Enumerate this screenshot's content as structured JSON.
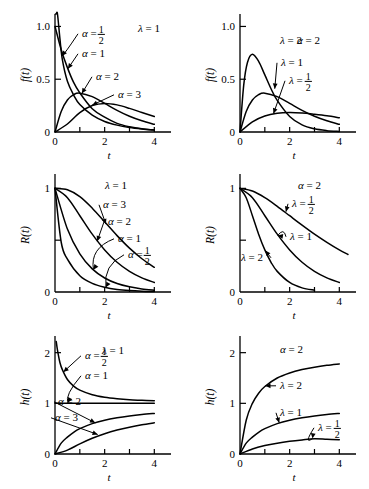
{
  "figure": {
    "name": "gamma-distribution-figure",
    "columns": [
      "varying alpha with lambda = 1",
      "varying lambda with alpha = 2"
    ],
    "rows": [
      "density f(t)",
      "reliability R(t)",
      "hazard h(t)"
    ]
  },
  "chart_data": [
    {
      "id": "panel-density-alpha",
      "type": "line",
      "title": "",
      "xlabel": "t",
      "ylabel": "f(t)",
      "xlim": [
        0,
        4.35
      ],
      "ylim": [
        0,
        1.08
      ],
      "xticks": [
        0,
        1,
        2,
        3,
        4
      ],
      "xticklabels": [
        "0",
        "",
        "2",
        "",
        "4"
      ],
      "yticks": [
        0,
        0.5,
        1.0
      ],
      "yticklabels": [
        "0",
        "0.5",
        "1.0"
      ],
      "grid": false,
      "legend": "inline-annotations",
      "fixed_param": {
        "symbol": "λ",
        "value": "1",
        "label": "λ = 1"
      },
      "series": [
        {
          "name": "alpha-one-half",
          "label": "α =",
          "label_frac": "1/2",
          "alpha": 0.5,
          "lambda": 1,
          "x": [
            0.02,
            0.05,
            0.1,
            0.2,
            0.3,
            0.5,
            0.75,
            1,
            1.5,
            2,
            2.5,
            3,
            3.5,
            4
          ],
          "y": [
            2.0,
            1.74,
            1.29,
            0.88,
            0.68,
            0.48,
            0.35,
            0.26,
            0.16,
            0.1,
            0.065,
            0.043,
            0.029,
            0.019
          ]
        },
        {
          "name": "alpha-one",
          "label": "α = 1",
          "alpha": 1,
          "lambda": 1,
          "x": [
            0,
            0.25,
            0.5,
            0.75,
            1,
            1.5,
            2,
            2.5,
            3,
            3.5,
            4
          ],
          "y": [
            1.0,
            0.78,
            0.61,
            0.47,
            0.37,
            0.22,
            0.14,
            0.082,
            0.05,
            0.03,
            0.018
          ]
        },
        {
          "name": "alpha-two",
          "label": "α = 2",
          "alpha": 2,
          "lambda": 1,
          "x": [
            0,
            0.25,
            0.5,
            0.75,
            1,
            1.5,
            2,
            2.5,
            3,
            3.5,
            4
          ],
          "y": [
            0,
            0.195,
            0.303,
            0.354,
            0.368,
            0.335,
            0.271,
            0.205,
            0.149,
            0.106,
            0.073
          ]
        },
        {
          "name": "alpha-three",
          "label": "α = 3",
          "alpha": 3,
          "lambda": 1,
          "x": [
            0,
            0.5,
            1,
            1.5,
            2,
            2.5,
            3,
            3.5,
            4
          ],
          "y": [
            0,
            0.076,
            0.184,
            0.251,
            0.271,
            0.257,
            0.224,
            0.185,
            0.147
          ]
        }
      ]
    },
    {
      "id": "panel-density-lambda",
      "type": "line",
      "title": "",
      "xlabel": "t",
      "ylabel": "f(t)",
      "xlim": [
        0,
        4.35
      ],
      "ylim": [
        0,
        1.08
      ],
      "xticks": [
        0,
        1,
        2,
        3,
        4
      ],
      "xticklabels": [
        "0",
        "",
        "2",
        "",
        "4"
      ],
      "yticks": [
        0,
        0.5,
        1.0
      ],
      "yticklabels": [
        "0",
        "0.5",
        "1.0"
      ],
      "grid": false,
      "fixed_param": {
        "symbol": "α",
        "value": "2",
        "label": "α = 2"
      },
      "series": [
        {
          "name": "lambda-two",
          "label": "λ = 2",
          "alpha": 2,
          "lambda": 2,
          "x": [
            0,
            0.15,
            0.3,
            0.5,
            0.75,
            1,
            1.25,
            1.5,
            2,
            2.5,
            3,
            3.5,
            4
          ],
          "y": [
            0,
            0.444,
            0.659,
            0.736,
            0.669,
            0.541,
            0.41,
            0.299,
            0.147,
            0.067,
            0.03,
            0.013,
            0.005
          ]
        },
        {
          "name": "lambda-one",
          "label": "λ = 1",
          "alpha": 2,
          "lambda": 1,
          "x": [
            0,
            0.25,
            0.5,
            0.75,
            1,
            1.5,
            2,
            2.5,
            3,
            3.5,
            4
          ],
          "y": [
            0,
            0.195,
            0.303,
            0.354,
            0.368,
            0.335,
            0.271,
            0.205,
            0.149,
            0.106,
            0.073
          ]
        },
        {
          "name": "lambda-one-half",
          "label": "λ =",
          "label_frac": "1/2",
          "alpha": 2,
          "lambda": 0.5,
          "x": [
            0,
            0.5,
            1,
            1.5,
            2,
            2.5,
            3,
            3.5,
            4
          ],
          "y": [
            0,
            0.097,
            0.152,
            0.177,
            0.184,
            0.179,
            0.167,
            0.153,
            0.135
          ]
        }
      ]
    },
    {
      "id": "panel-reliability-alpha",
      "type": "line",
      "title": "",
      "xlabel": "t",
      "ylabel": "R(t)",
      "xlim": [
        0,
        4.35
      ],
      "ylim": [
        0,
        1.1
      ],
      "xticks": [
        0,
        1,
        2,
        3,
        4
      ],
      "xticklabels": [
        "0",
        "",
        "2",
        "",
        "4"
      ],
      "yticks": [
        0,
        0.5,
        1
      ],
      "yticklabels": [
        "0",
        "",
        "1"
      ],
      "grid": false,
      "fixed_param": {
        "symbol": "λ",
        "value": "1",
        "label": "λ = 1"
      },
      "series": [
        {
          "name": "alpha-three",
          "label": "α = 3",
          "alpha": 3,
          "lambda": 1,
          "x": [
            0,
            0.5,
            1,
            1.5,
            2,
            2.5,
            3,
            3.5,
            4
          ],
          "y": [
            1.0,
            0.986,
            0.92,
            0.809,
            0.677,
            0.544,
            0.423,
            0.321,
            0.238
          ]
        },
        {
          "name": "alpha-two",
          "label": "α = 2",
          "alpha": 2,
          "lambda": 1,
          "x": [
            0,
            0.5,
            1,
            1.5,
            2,
            2.5,
            3,
            3.5,
            4
          ],
          "y": [
            1.0,
            0.91,
            0.736,
            0.558,
            0.406,
            0.287,
            0.199,
            0.136,
            0.092
          ]
        },
        {
          "name": "alpha-one",
          "label": "α = 1",
          "alpha": 1,
          "lambda": 1,
          "x": [
            0,
            0.5,
            1,
            1.5,
            2,
            2.5,
            3,
            3.5,
            4
          ],
          "y": [
            1.0,
            0.607,
            0.368,
            0.223,
            0.135,
            0.082,
            0.05,
            0.03,
            0.018
          ]
        },
        {
          "name": "alpha-one-half",
          "label": "α =",
          "label_frac": "1/2",
          "alpha": 0.5,
          "lambda": 1,
          "x": [
            0,
            0.25,
            0.5,
            1,
            1.5,
            2,
            2.5,
            3,
            3.5,
            4
          ],
          "y": [
            1.0,
            0.48,
            0.317,
            0.157,
            0.083,
            0.046,
            0.025,
            0.014,
            0.008,
            0.005
          ]
        }
      ]
    },
    {
      "id": "panel-reliability-lambda",
      "type": "line",
      "title": "",
      "xlabel": "t",
      "ylabel": "R(t)",
      "xlim": [
        0,
        4.35
      ],
      "ylim": [
        0,
        1.1
      ],
      "xticks": [
        0,
        1,
        2,
        3,
        4
      ],
      "xticklabels": [
        "0",
        "",
        "2",
        "",
        "4"
      ],
      "yticks": [
        0,
        0.5,
        1
      ],
      "yticklabels": [
        "0",
        "",
        "1"
      ],
      "grid": false,
      "fixed_param": {
        "symbol": "α",
        "value": "2",
        "label": "α = 2"
      },
      "series": [
        {
          "name": "lambda-one-half",
          "label": "λ =",
          "label_frac": "1/2",
          "alpha": 2,
          "lambda": 0.5,
          "x": [
            0,
            0.5,
            1,
            1.5,
            2,
            2.5,
            3,
            3.5,
            4,
            4.35
          ],
          "y": [
            1.0,
            0.974,
            0.91,
            0.827,
            0.736,
            0.645,
            0.558,
            0.479,
            0.406,
            0.362
          ]
        },
        {
          "name": "lambda-one",
          "label": "λ = 1",
          "alpha": 2,
          "lambda": 1,
          "x": [
            0,
            0.5,
            1,
            1.5,
            2,
            2.5,
            3,
            3.5,
            4
          ],
          "y": [
            1.0,
            0.91,
            0.736,
            0.558,
            0.406,
            0.287,
            0.199,
            0.136,
            0.092
          ]
        },
        {
          "name": "lambda-two",
          "label": "λ = 2",
          "alpha": 2,
          "lambda": 2,
          "x": [
            0,
            0.25,
            0.5,
            0.75,
            1,
            1.25,
            1.5,
            2,
            2.5,
            3
          ],
          "y": [
            1.0,
            0.91,
            0.736,
            0.558,
            0.406,
            0.287,
            0.199,
            0.092,
            0.04,
            0.017
          ]
        }
      ]
    },
    {
      "id": "panel-hazard-alpha",
      "type": "line",
      "title": "",
      "xlabel": "t",
      "ylabel": "h(t)",
      "xlim": [
        0,
        4.35
      ],
      "ylim": [
        0,
        2.25
      ],
      "xticks": [
        0,
        1,
        2,
        3,
        4
      ],
      "xticklabels": [
        "0",
        "",
        "2",
        "",
        "4"
      ],
      "yticks": [
        0,
        1,
        2
      ],
      "yticklabels": [
        "0",
        "1",
        "2"
      ],
      "grid": false,
      "fixed_param": {
        "symbol": "λ",
        "value": "1",
        "label": "λ = 1"
      },
      "series": [
        {
          "name": "alpha-one-half",
          "label": "α =",
          "label_frac": "1/2",
          "alpha": 0.5,
          "lambda": 1,
          "x": [
            0.05,
            0.1,
            0.2,
            0.3,
            0.5,
            0.75,
            1,
            1.5,
            2,
            2.5,
            3,
            3.5,
            4
          ],
          "y": [
            2.22,
            2.05,
            1.8,
            1.66,
            1.47,
            1.34,
            1.26,
            1.17,
            1.12,
            1.09,
            1.07,
            1.06,
            1.05
          ]
        },
        {
          "name": "alpha-one",
          "label": "α = 1",
          "alpha": 1,
          "lambda": 1,
          "x": [
            0,
            1,
            2,
            3,
            4
          ],
          "y": [
            1.0,
            1.0,
            1.0,
            1.0,
            1.0
          ]
        },
        {
          "name": "alpha-two",
          "label": "α = 2",
          "alpha": 2,
          "lambda": 1,
          "x": [
            0,
            0.25,
            0.5,
            0.75,
            1,
            1.5,
            2,
            2.5,
            3,
            3.5,
            4
          ],
          "y": [
            0,
            0.214,
            0.333,
            0.429,
            0.5,
            0.6,
            0.667,
            0.714,
            0.75,
            0.778,
            0.8
          ]
        },
        {
          "name": "alpha-three",
          "label": "α = 3",
          "alpha": 3,
          "lambda": 1,
          "x": [
            0,
            0.5,
            1,
            1.5,
            2,
            2.5,
            3,
            3.5,
            4
          ],
          "y": [
            0,
            0.077,
            0.2,
            0.31,
            0.4,
            0.472,
            0.529,
            0.576,
            0.615
          ]
        }
      ]
    },
    {
      "id": "panel-hazard-lambda",
      "type": "line",
      "title": "",
      "xlabel": "t",
      "ylabel": "h(t)",
      "xlim": [
        0,
        4.35
      ],
      "ylim": [
        0,
        2.25
      ],
      "xticks": [
        0,
        1,
        2,
        3,
        4
      ],
      "xticklabels": [
        "0",
        "",
        "2",
        "",
        "4"
      ],
      "yticks": [
        0,
        1,
        2
      ],
      "yticklabels": [
        "0",
        "1",
        "2"
      ],
      "grid": false,
      "fixed_param": {
        "symbol": "α",
        "value": "2",
        "label": "α = 2"
      },
      "series": [
        {
          "name": "lambda-two",
          "label": "λ = 2",
          "alpha": 2,
          "lambda": 2,
          "x": [
            0,
            0.25,
            0.5,
            0.75,
            1,
            1.5,
            2,
            2.5,
            3,
            3.5,
            4
          ],
          "y": [
            0,
            0.667,
            1.0,
            1.2,
            1.333,
            1.5,
            1.6,
            1.667,
            1.714,
            1.75,
            1.778
          ]
        },
        {
          "name": "lambda-one",
          "label": "λ = 1",
          "alpha": 2,
          "lambda": 1,
          "x": [
            0,
            0.25,
            0.5,
            0.75,
            1,
            1.5,
            2,
            2.5,
            3,
            3.5,
            4
          ],
          "y": [
            0,
            0.214,
            0.333,
            0.429,
            0.5,
            0.6,
            0.667,
            0.714,
            0.75,
            0.778,
            0.8
          ]
        },
        {
          "name": "lambda-one-half",
          "label": "λ =",
          "label_frac": "1/2",
          "alpha": 2,
          "lambda": 0.5,
          "x": [
            0,
            0.5,
            1,
            1.5,
            2,
            2.5,
            3,
            3.5,
            4
          ],
          "y": [
            0,
            0.1,
            0.167,
            0.214,
            0.25,
            0.278,
            0.3,
            0.29,
            0.28
          ]
        }
      ]
    }
  ]
}
